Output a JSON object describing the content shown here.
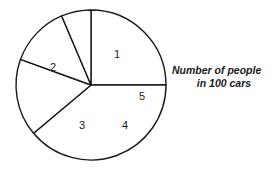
{
  "chart_data": {
    "type": "pie",
    "title": "",
    "caption_line_1": "Number of people",
    "caption_line_2": "in 100 cars",
    "categories": [
      "1",
      "2",
      "3",
      "4",
      "5"
    ],
    "slice_labels": [
      "1",
      "2",
      "3",
      "4",
      "5"
    ],
    "values": [
      25,
      38.9,
      16.7,
      13.1,
      6.3
    ],
    "units": "percent of 100 cars",
    "angles_deg": [
      90,
      140,
      60,
      47,
      23
    ],
    "start_angle_deg": -90,
    "direction": "clockwise",
    "legend": "none",
    "grid": false,
    "colors": {
      "slice_fill": "#ffffff",
      "slice_stroke": "#1a1a1a",
      "label_text": "#1a1a1a",
      "caption_text": "#1a1a1a",
      "background": "#ffffff"
    },
    "geometry": {
      "center_x": 91,
      "center_y": 85,
      "radius": 75
    },
    "label_positions": [
      {
        "label": "1",
        "x": 117,
        "y": 55
      },
      {
        "label": "2",
        "x": 53,
        "y": 68
      },
      {
        "label": "3",
        "x": 82,
        "y": 126
      },
      {
        "label": "4",
        "x": 125,
        "y": 126
      },
      {
        "label": "5",
        "x": 142,
        "y": 97
      }
    ]
  }
}
